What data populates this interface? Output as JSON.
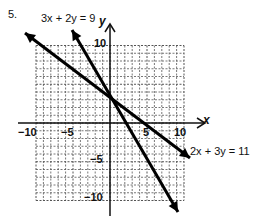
{
  "problem": {
    "number": "5."
  },
  "chart_data": {
    "type": "line",
    "title": "",
    "xlabel": "x",
    "ylabel": "y",
    "xlim": [
      -10,
      10
    ],
    "ylim": [
      -10,
      10
    ],
    "grid": true,
    "x_ticks": [
      "-10",
      "-5",
      "5",
      "10"
    ],
    "y_ticks": [
      "10",
      "-5",
      "-10"
    ],
    "series": [
      {
        "name": "3x + 2y = 9",
        "equation": "3x + 2y = 9",
        "slope": -1.5,
        "intercept": 4.5,
        "points": [
          [
            -2.5,
            8.25
          ],
          [
            4.5,
            -2.25
          ],
          [
            5.5,
            -3.75
          ]
        ]
      },
      {
        "name": "2x + 3y = 11",
        "equation": "2x + 3y = 11",
        "slope": -0.667,
        "intercept": 3.667,
        "points": [
          [
            -8,
            9
          ],
          [
            1,
            3
          ],
          [
            10,
            -3
          ]
        ]
      }
    ],
    "intersection": [
      1,
      3
    ],
    "annotations": [
      "3x + 2y = 9",
      "2x + 3y = 11"
    ]
  },
  "labels": {
    "eq1": "3x + 2y = 9",
    "eq2": "2x + 3y = 11",
    "x_axis": "x",
    "y_axis": "y",
    "tick_x_neg10": "−10",
    "tick_x_neg5": "−5",
    "tick_x_5": "5",
    "tick_x_10": "10",
    "tick_y_10": "10",
    "tick_y_neg5": "−5",
    "tick_y_neg10": "−10"
  }
}
